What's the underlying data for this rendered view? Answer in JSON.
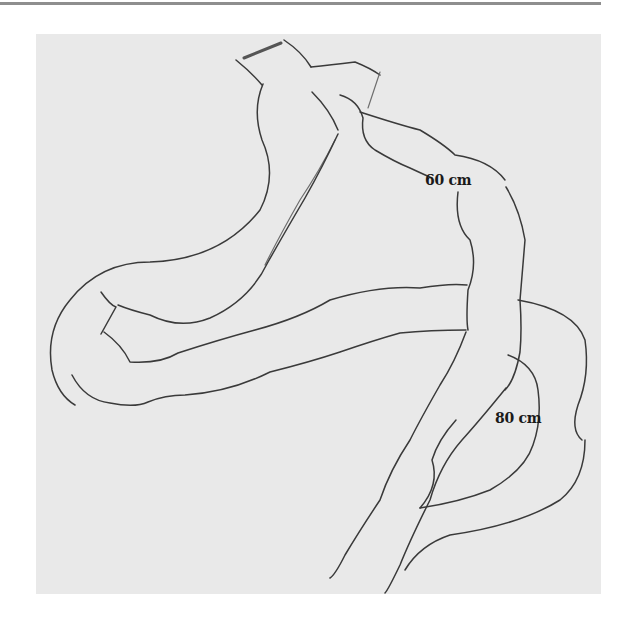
{
  "diagram": {
    "type": "surgical-illustration",
    "labels": [
      {
        "id": "limb-1",
        "text": "60 cm"
      },
      {
        "id": "limb-2",
        "text": "80 cm"
      }
    ],
    "colors": {
      "paper": "#e9e9e9",
      "line": "#3a3a3a",
      "label": "#1a1a1a",
      "top_rule": "#8e8e8e"
    }
  }
}
